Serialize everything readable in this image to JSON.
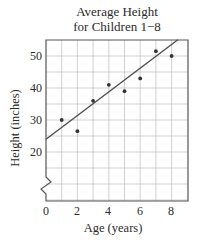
{
  "chart": {
    "title_line1": "Average Height",
    "title_line2": "for Children 1−8",
    "xlabel": "Age (years)",
    "ylabel": "Height (inches)",
    "x_ticks": [
      "0",
      "2",
      "4",
      "6",
      "8"
    ],
    "y_ticks": [
      "20",
      "30",
      "40",
      "50"
    ]
  },
  "chart_data": {
    "type": "scatter",
    "title": "Average Height for Children 1−8",
    "xlabel": "Age (years)",
    "ylabel": "Height (inches)",
    "x": [
      1,
      2,
      3,
      4,
      5,
      6,
      7,
      8
    ],
    "values": [
      30,
      26.5,
      36,
      41,
      39,
      43,
      51.5,
      50
    ],
    "trend_line": {
      "intercept": 24,
      "slope": 3.7,
      "x_range": [
        0,
        8.4
      ]
    },
    "xlim": [
      0,
      9
    ],
    "ylim": [
      0,
      55
    ],
    "x_tick_labels": [
      "0",
      "2",
      "4",
      "6",
      "8"
    ],
    "y_tick_labels": [
      "20",
      "30",
      "40",
      "50"
    ],
    "y_axis_break": true,
    "grid": true,
    "legend": null
  }
}
